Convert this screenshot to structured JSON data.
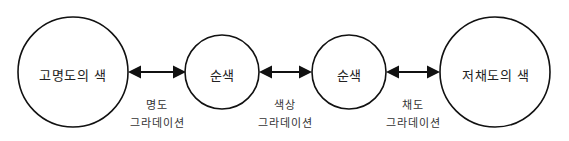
{
  "nodes": [
    {
      "label": "고명도의 색"
    },
    {
      "label": "순색"
    },
    {
      "label": "순색"
    },
    {
      "label": "저채도의 색"
    }
  ],
  "edges": [
    {
      "line1": "명도",
      "line2": "그라데이션"
    },
    {
      "line1": "색상",
      "line2": "그라데이션"
    },
    {
      "line1": "채도",
      "line2": "그라데이션"
    }
  ]
}
